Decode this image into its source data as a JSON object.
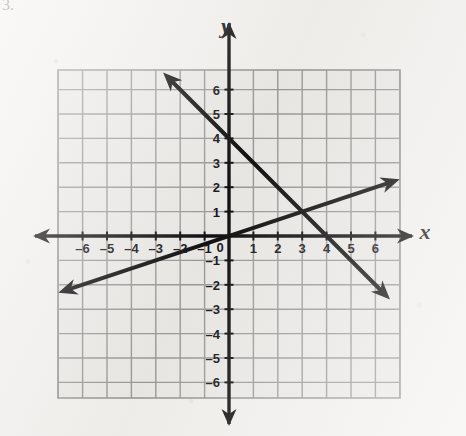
{
  "page": {
    "background_color": "#f2f1ee",
    "corner_mark": "3."
  },
  "chart_data": {
    "type": "line",
    "title": "",
    "xlabel": "x",
    "ylabel": "y",
    "xlim": [
      -7,
      7
    ],
    "ylim": [
      -7,
      7
    ],
    "grid": true,
    "legend": "none",
    "x_tick_labels": [
      "-6",
      "-5",
      "-4",
      "-3",
      "-2",
      "-1",
      "0",
      "1",
      "2",
      "3",
      "4",
      "5",
      "6"
    ],
    "x_tick_values": [
      -6,
      -5,
      -4,
      -3,
      -2,
      -1,
      0,
      1,
      2,
      3,
      4,
      5,
      6
    ],
    "y_tick_labels": [
      "6",
      "5",
      "4",
      "3",
      "2",
      "1",
      "-1",
      "-2",
      "-3",
      "-4",
      "-5",
      "-6"
    ],
    "y_tick_values": [
      6,
      5,
      4,
      3,
      2,
      1,
      -1,
      -2,
      -3,
      -4,
      -5,
      -6
    ],
    "origin_label": "0",
    "series": [
      {
        "name": "descending-line",
        "equation": "y = -x + 4",
        "slope": -1,
        "intercept": 4,
        "points": [
          [
            -2.7,
            6.7
          ],
          [
            0,
            4
          ],
          [
            3,
            1
          ],
          [
            4,
            0
          ],
          [
            6.6,
            -2.6
          ]
        ],
        "arrows": "both",
        "color": "#111111",
        "width": 4
      },
      {
        "name": "ascending-line",
        "equation": "y = (1/3)x",
        "slope": 0.3333,
        "intercept": 0,
        "points": [
          [
            -7,
            -2.33
          ],
          [
            -3,
            -1
          ],
          [
            0,
            0
          ],
          [
            3,
            1
          ],
          [
            7,
            2.33
          ]
        ],
        "arrows": "both",
        "color": "#111111",
        "width": 4
      }
    ],
    "intersection": [
      3,
      1
    ],
    "annotations": []
  },
  "axes": {
    "x_axis_name": "x",
    "y_axis_name": "y",
    "x_axis_arrows": "both",
    "y_axis_arrows": "both",
    "axis_color": "#111111",
    "grid_color": "#9a9a99",
    "plot_fill": "#eceae7"
  }
}
